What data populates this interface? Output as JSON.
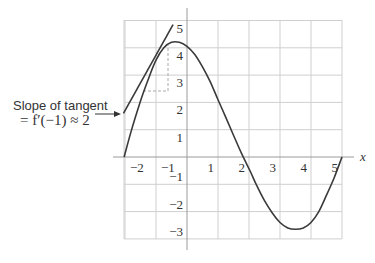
{
  "chart_data": {
    "type": "line",
    "title": "",
    "xlabel": "x",
    "ylabel": "",
    "xlim": [
      -2.03,
      5.0
    ],
    "ylim": [
      -3,
      5
    ],
    "grid": true,
    "x_ticks": [
      -2,
      -1,
      1,
      2,
      3,
      4,
      5
    ],
    "x_tick_labels": [
      "−2",
      "−1",
      "1",
      "2",
      "3",
      "4",
      "5"
    ],
    "y_ticks": [
      5,
      4,
      3,
      2,
      1,
      -1,
      -2,
      -3
    ],
    "y_tick_labels": [
      "5",
      "4",
      "3",
      "2",
      "1",
      "−1",
      "−2",
      "−3"
    ],
    "series": [
      {
        "name": "f(x)",
        "x": [
          -2.03,
          -1.8,
          -1.5,
          -1.25,
          -1.0,
          -0.75,
          -0.5,
          -0.25,
          0.0,
          0.25,
          0.5,
          0.75,
          1.0,
          1.25,
          1.5,
          1.75,
          2.05,
          2.25,
          2.5,
          2.75,
          3.0,
          3.25,
          3.5,
          3.75,
          4.0,
          4.25,
          4.5,
          4.75,
          5.0
        ],
        "values": [
          0,
          0.95,
          2.05,
          2.85,
          3.55,
          4.0,
          4.2,
          4.2,
          4.05,
          3.75,
          3.3,
          2.75,
          2.1,
          1.45,
          0.8,
          0.15,
          -0.55,
          -1.05,
          -1.6,
          -2.05,
          -2.4,
          -2.6,
          -2.65,
          -2.6,
          -2.4,
          -2.0,
          -1.4,
          -0.75,
          0
        ]
      },
      {
        "name": "tangent at x = -1",
        "x": [
          -2.05,
          -0.45
        ],
        "values": [
          1.6,
          4.85
        ]
      }
    ],
    "annotations": [
      {
        "text_line1": "Slope of tangent",
        "text_line2": "= f′(−1) ≈ 2",
        "points_to": [
          -2.05,
          1.6
        ]
      },
      {
        "type": "dashed-rise-run",
        "run_from": [
          -1.4,
          2.4
        ],
        "corner": [
          -0.6,
          2.4
        ],
        "rise_to": [
          -0.6,
          4.1
        ]
      }
    ]
  },
  "annotation": {
    "line1": "Slope of tangent",
    "line2": "= f′(−1) ≈ 2"
  },
  "axis_label_x": "x"
}
